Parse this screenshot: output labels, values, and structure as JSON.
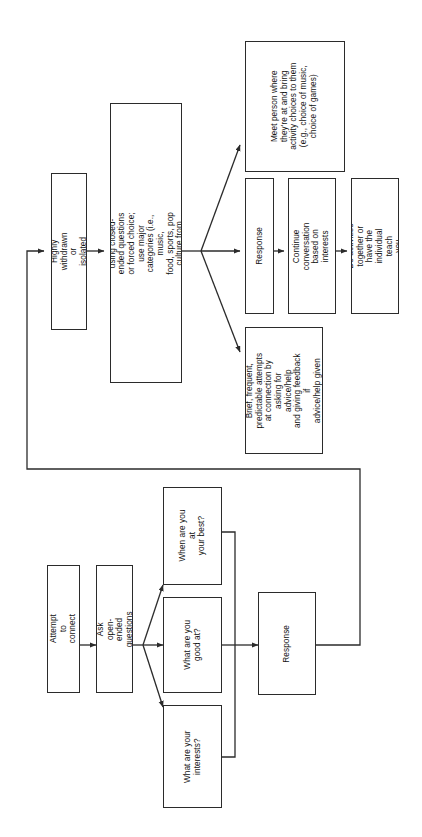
{
  "diagram": {
    "orientation": "rotated-90-counterclockwise",
    "line_color": "#2b2b2b",
    "background_color": "#ffffff",
    "nodes": {
      "highly_withdrawn": "Highly withdrawn or isolated",
      "narrow_scope": "Narrow scope using closed-ended questions\nor forced choice; use major categories (i.e., music,\nfood, sports, pop culture from prechallenges)",
      "meet_person": "Meet person where\nthey're at and bring\nactivity choices to them\n(e.g., choice of music,\nchoice of games)",
      "response_top": "Response",
      "continue_conversation": "Continue conversation\nbased on interests",
      "do_activities": "Do activities together or\nhave the individual teach\nyou",
      "brief_frequent": "Brief, frequent,\npredictable attempts\nat connection by\nasking for advice/help\nand giving feedback if\nadvice/help given",
      "attempt_to_connect": "Attempt to connect",
      "ask_open_ended": "Ask open-ended\nquestions",
      "q_when_best": "When are you at\nyour best?",
      "q_good_at": "What are you\ngood at?",
      "q_interests": "What are your\ninterests?",
      "response_bottom": "Response"
    },
    "edges": [
      {
        "from": "response_bottom",
        "to": "highly_withdrawn",
        "style": "orthogonal-feedback-loop",
        "arrow": true
      },
      {
        "from": "highly_withdrawn",
        "to": "narrow_scope",
        "style": "straight",
        "arrow": true
      },
      {
        "from": "narrow_scope",
        "to": "meet_person",
        "style": "diagonal",
        "arrow": true
      },
      {
        "from": "narrow_scope",
        "to": "response_top",
        "style": "straight",
        "arrow": true
      },
      {
        "from": "narrow_scope",
        "to": "brief_frequent",
        "style": "diagonal",
        "arrow": true
      },
      {
        "from": "response_top",
        "to": "continue_conversation",
        "style": "straight",
        "arrow": true
      },
      {
        "from": "continue_conversation",
        "to": "do_activities",
        "style": "straight",
        "arrow": true
      },
      {
        "from": "attempt_to_connect",
        "to": "ask_open_ended",
        "style": "straight",
        "arrow": true
      },
      {
        "from": "ask_open_ended",
        "to": "q_when_best",
        "style": "diagonal",
        "arrow": true
      },
      {
        "from": "ask_open_ended",
        "to": "q_good_at",
        "style": "straight",
        "arrow": true
      },
      {
        "from": "ask_open_ended",
        "to": "q_interests",
        "style": "diagonal",
        "arrow": true
      },
      {
        "from": "q_when_best",
        "to": "response_bottom",
        "style": "bracket-merge",
        "arrow": true
      },
      {
        "from": "q_good_at",
        "to": "response_bottom",
        "style": "bracket-merge",
        "arrow": true
      },
      {
        "from": "q_interests",
        "to": "response_bottom",
        "style": "bracket-merge",
        "arrow": true
      }
    ]
  }
}
